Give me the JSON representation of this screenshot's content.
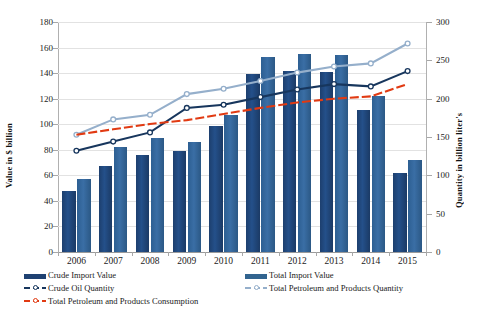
{
  "chart_data": {
    "type": "bar",
    "title": "",
    "xlabel": "",
    "ylabel": "Value in $ billion",
    "y2label": "Quantity in billion liter's",
    "categories": [
      "2006",
      "2007",
      "2008",
      "2009",
      "2010",
      "2011",
      "2012",
      "2013",
      "2014",
      "2015"
    ],
    "ylim": [
      0,
      180
    ],
    "y2lim": [
      0,
      300
    ],
    "yticks": [
      0,
      20,
      40,
      60,
      80,
      100,
      120,
      140,
      160,
      180
    ],
    "y2ticks": [
      0,
      50,
      100,
      150,
      200,
      250,
      300
    ],
    "grid": true,
    "legend_position": "bottom",
    "series": [
      {
        "name": "Crude Import Value",
        "type": "bar",
        "axis": "left",
        "color": "#1F4172",
        "values": [
          48,
          67,
          76,
          79,
          99,
          139,
          142,
          141,
          111,
          62
        ]
      },
      {
        "name": "Total Import Value",
        "type": "bar",
        "axis": "left",
        "color": "#32648F",
        "values": [
          57,
          82,
          89,
          86,
          107,
          153,
          155,
          154,
          122,
          72
        ]
      },
      {
        "name": "Crude Oil Quantity",
        "type": "line",
        "axis": "right",
        "color": "#17365D",
        "values": [
          132,
          144,
          156,
          188,
          192,
          202,
          212,
          219,
          216,
          236
        ]
      },
      {
        "name": "Total Petroleum and Products Quantity",
        "type": "line",
        "axis": "right",
        "color": "#95AFCB",
        "values": [
          153,
          173,
          179,
          206,
          213,
          223,
          234,
          242,
          246,
          272
        ]
      },
      {
        "name": "Total Petroleum and Products Consumption",
        "type": "line",
        "axis": "right",
        "color": "#E13A12",
        "values": [
          153,
          160,
          167,
          172,
          180,
          188,
          195,
          200,
          203,
          219
        ]
      }
    ]
  },
  "axes": {
    "left_title": "Value in $ billion",
    "right_title": "Quantity in billion liter's"
  }
}
